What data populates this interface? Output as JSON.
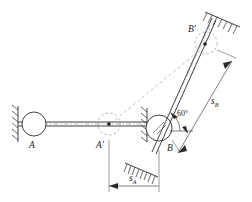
{
  "figure": {
    "type": "mechanism-kinematics-diagram",
    "background_color": "#ffffff",
    "line_color": "#2a2a2a",
    "ghost_color": "#a8a8a8"
  },
  "labels": {
    "joint_a": "A",
    "joint_a_prime": "A′",
    "joint_b": "B",
    "joint_b_prime": "B′",
    "angle": "60°",
    "displacement_a_base": "s",
    "displacement_a_sub": "A",
    "displacement_b_base": "s",
    "displacement_b_sub": "B"
  },
  "geometry": {
    "joint_a": {
      "x": 33,
      "y": 124,
      "r": 12
    },
    "joint_a_prime": {
      "x": 109,
      "y": 124,
      "r": 11
    },
    "joint_b": {
      "x": 159,
      "y": 128,
      "r": 13
    },
    "joint_b_prime": {
      "x": 206,
      "y": 43,
      "r": 11
    },
    "angle_value_deg": 60,
    "horizontal_rod": {
      "from_x": 33,
      "from_y": 124,
      "to_x": 159,
      "to_y": 124
    },
    "inclined_rod": {
      "from_x": 159,
      "from_y": 128,
      "to_x": 215,
      "to_y": 20
    }
  },
  "supports": {
    "left_wall": {
      "x": 14,
      "y": 108,
      "height": 32,
      "orientation": "vertical"
    },
    "mid_wall": {
      "x": 143,
      "y": 110,
      "height": 30,
      "orientation": "vertical"
    },
    "lower_ground": {
      "x": 126,
      "y": 166,
      "width": 34,
      "orientation": "inclined"
    },
    "top_support": {
      "x": 214,
      "y": 14,
      "width": 32,
      "orientation": "inclined"
    }
  },
  "dimensions": [
    {
      "name": "s_A",
      "label_base": "s",
      "label_sub": "A",
      "orientation": "horizontal",
      "from_x": 109,
      "from_y": 186,
      "to_x": 159,
      "to_y": 186
    },
    {
      "name": "s_B",
      "label_base": "s",
      "label_sub": "B",
      "orientation": "inclined",
      "from_x": 180,
      "from_y": 150,
      "to_x": 234,
      "to_y": 60
    }
  ]
}
